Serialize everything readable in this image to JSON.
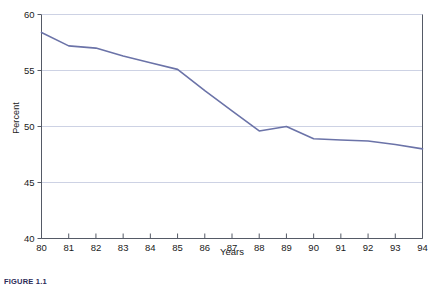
{
  "figure": {
    "caption": "FIGURE 1.1"
  },
  "chart_data": {
    "type": "line",
    "title": "",
    "xlabel": "Years",
    "ylabel": "Percent",
    "x": [
      80,
      81,
      82,
      83,
      84,
      85,
      86,
      87,
      88,
      89,
      90,
      91,
      92,
      93,
      94
    ],
    "xticklabels": [
      "80",
      "81",
      "82",
      "83",
      "84",
      "85",
      "86",
      "87",
      "88",
      "89",
      "90",
      "91",
      "92",
      "93",
      "94"
    ],
    "values": [
      58.4,
      57.2,
      57.0,
      56.3,
      55.7,
      55.1,
      53.2,
      51.4,
      49.6,
      50.0,
      48.9,
      48.8,
      48.7,
      48.4,
      48.0
    ],
    "yticklabels": [
      "40",
      "45",
      "50",
      "55",
      "60"
    ],
    "yticks": [
      40,
      45,
      50,
      55,
      60
    ],
    "ylim": [
      40,
      60
    ],
    "xlim": [
      80,
      94
    ],
    "grid": true,
    "grid_axis": "y",
    "legend": null,
    "series_color": "#6b73a8",
    "grid_color": "#cdd2e4",
    "axis_color": "#555a66",
    "background": "#ffffff"
  }
}
